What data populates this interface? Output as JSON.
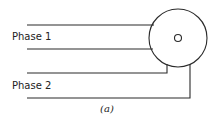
{
  "diagram": {
    "labels": {
      "phase1": "Phase 1",
      "phase2": "Phase 2"
    },
    "caption": "(a)",
    "colors": {
      "stroke": "#2a2a2a",
      "text": "#222222",
      "background": "#ffffff"
    },
    "components": [
      {
        "name": "motor",
        "shape": "circle",
        "has_center_hole": true
      },
      {
        "name": "phase-1-winding",
        "wires": 2
      },
      {
        "name": "phase-2-winding",
        "wires": 2
      }
    ]
  }
}
